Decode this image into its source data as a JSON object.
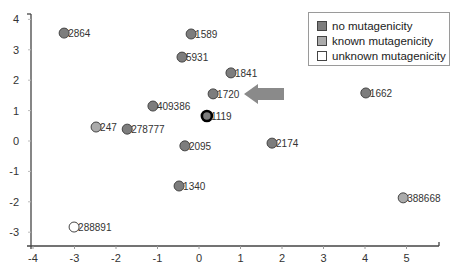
{
  "chart_data": {
    "type": "scatter",
    "title": "",
    "xlabel": "",
    "ylabel": "",
    "xlim": [
      -4,
      5.8
    ],
    "ylim": [
      -3.45,
      4.2
    ],
    "x_ticks": [
      -4,
      -3,
      -2,
      -1,
      0,
      1,
      2,
      3,
      4,
      5
    ],
    "y_ticks": [
      -3,
      -2,
      -1,
      0,
      1,
      2,
      3,
      4
    ],
    "grid": false,
    "legend_position": "top-right",
    "legend": [
      {
        "label": "no mutagenicity",
        "color": "#7d7d7d"
      },
      {
        "label": "known mutagenicity",
        "color": "#ababab"
      },
      {
        "label": "unknown mutagenicity",
        "color": "#ffffff"
      }
    ],
    "points": [
      {
        "label": "2864",
        "x": -3.25,
        "y": 3.55,
        "category": "no mutagenicity"
      },
      {
        "label": "1589",
        "x": -0.19,
        "y": 3.52,
        "category": "no mutagenicity"
      },
      {
        "label": "5931",
        "x": -0.41,
        "y": 2.76,
        "category": "no mutagenicity"
      },
      {
        "label": "1841",
        "x": 0.77,
        "y": 2.24,
        "category": "no mutagenicity"
      },
      {
        "label": "1720",
        "x": 0.34,
        "y": 1.55,
        "category": "no mutagenicity"
      },
      {
        "label": "1662",
        "x": 4.02,
        "y": 1.58,
        "category": "no mutagenicity"
      },
      {
        "label": "409386",
        "x": -1.11,
        "y": 1.15,
        "category": "no mutagenicity"
      },
      {
        "label": "1119",
        "x": 0.19,
        "y": 0.82,
        "category": "no mutagenicity",
        "highlighted": true
      },
      {
        "label": "247",
        "x": -2.48,
        "y": 0.46,
        "category": "known mutagenicity"
      },
      {
        "label": "278777",
        "x": -1.73,
        "y": 0.39,
        "category": "no mutagenicity"
      },
      {
        "label": "2095",
        "x": -0.34,
        "y": -0.16,
        "category": "no mutagenicity"
      },
      {
        "label": "2174",
        "x": 1.76,
        "y": -0.07,
        "category": "no mutagenicity"
      },
      {
        "label": "1340",
        "x": -0.48,
        "y": -1.48,
        "category": "no mutagenicity"
      },
      {
        "label": "388668",
        "x": 4.92,
        "y": -1.87,
        "category": "known mutagenicity"
      },
      {
        "label": "288891",
        "x": -3.01,
        "y": -2.83,
        "category": "unknown mutagenicity"
      }
    ],
    "annotations": [
      {
        "type": "arrow",
        "direction": "left",
        "pointing_to": "1720",
        "color": "#8a8a8a"
      }
    ]
  },
  "legend": {
    "items": [
      {
        "label": "no mutagenicity"
      },
      {
        "label": "known mutagenicity"
      },
      {
        "label": "unknown mutagenicity"
      }
    ]
  }
}
